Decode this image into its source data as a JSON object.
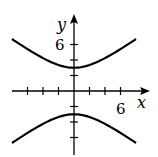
{
  "chart_data": {
    "type": "line",
    "title": "",
    "equation": "y^2/9 - x^2/16 = 1",
    "xlabel": "x",
    "ylabel": "y",
    "xlim": [
      -8,
      9
    ],
    "ylim": [
      -8,
      9.5
    ],
    "grid": false,
    "x_ticks": [
      -6,
      -4,
      -2,
      2,
      4,
      6
    ],
    "y_ticks": [
      -6,
      -4,
      -2,
      2,
      4,
      6
    ],
    "x_tick_labels_shown": {
      "6": "6"
    },
    "y_tick_labels_shown": {
      "6": "6"
    },
    "vertices": [
      [
        0,
        3
      ],
      [
        0,
        -3
      ]
    ],
    "series": [
      {
        "name": "upper branch",
        "x": [
          -8,
          -6,
          -4,
          -2,
          0,
          2,
          4,
          6,
          8
        ],
        "y": [
          6.71,
          5.41,
          4.24,
          3.35,
          3,
          3.35,
          4.24,
          5.41,
          6.71
        ]
      },
      {
        "name": "lower branch",
        "x": [
          -8,
          -6,
          -4,
          -2,
          0,
          2,
          4,
          6,
          8
        ],
        "y": [
          -6.71,
          -5.41,
          -4.24,
          -3.35,
          -3,
          -3.35,
          -4.24,
          -5.41,
          -6.71
        ]
      }
    ]
  },
  "labels": {
    "x_axis": "x",
    "y_axis": "y",
    "x_tick_6": "6",
    "y_tick_6": "6"
  },
  "colors": {
    "curve": "#000000",
    "axis": "#000000",
    "background": "#ffffff"
  }
}
